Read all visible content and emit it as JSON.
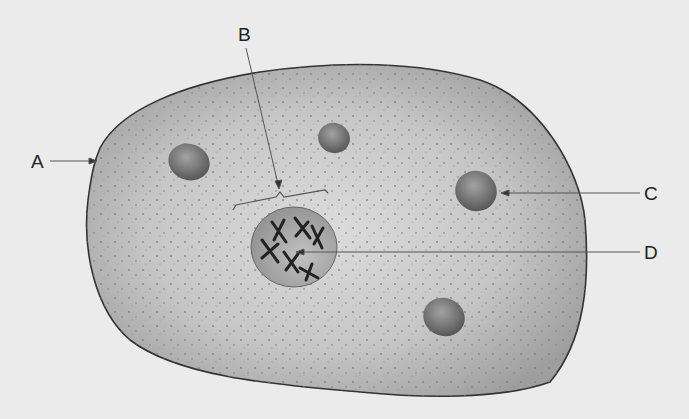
{
  "diagram": {
    "labels": {
      "A": "A",
      "B": "B",
      "C": "C",
      "D": "D"
    },
    "label_targets": {
      "A": "cell membrane",
      "B": "cytoplasm region (bracket)",
      "C": "organelle",
      "D": "nucleus with chromosomes"
    },
    "colors": {
      "background": "#ebebeb",
      "cell_fill": "#c4c4c4",
      "cell_outline": "#333333",
      "organelle_fill": "#7a7a7a",
      "nucleus_fill": "#a9a9a9",
      "chromosome": "#222222",
      "leader_line": "#555555"
    }
  }
}
